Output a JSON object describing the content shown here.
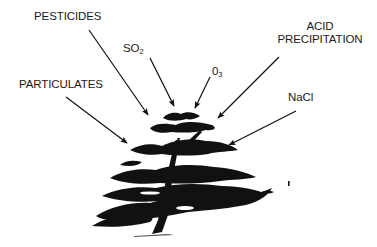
{
  "diagram": {
    "labels": {
      "pesticides": "PESTICIDES",
      "so2_main": "SO",
      "so2_sub": "2",
      "o3_main": "0",
      "o3_sub": "3",
      "acid_line1": "ACID",
      "acid_line2": "PRECIPITATION",
      "particulates": "PARTICULATES",
      "nacl": "NaCl"
    },
    "arrows": [
      {
        "from": "pesticides",
        "to": "tree-crown"
      },
      {
        "from": "so2",
        "to": "tree-crown"
      },
      {
        "from": "o3",
        "to": "tree-crown"
      },
      {
        "from": "acid-precipitation",
        "to": "tree-crown"
      },
      {
        "from": "particulates",
        "to": "tree-crown"
      },
      {
        "from": "nacl",
        "to": "tree-crown"
      }
    ],
    "colors": {
      "ink": "#111111",
      "text": "#1a1a1a",
      "background": "#ffffff"
    }
  }
}
